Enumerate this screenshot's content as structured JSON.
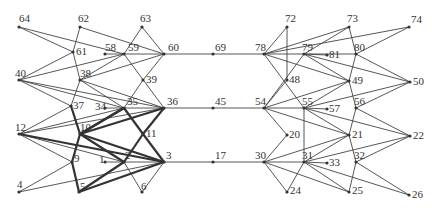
{
  "diagram": {
    "type": "network-graph",
    "colors": {
      "edge": "#444444",
      "thick_edge": "#333333",
      "label": "#333333",
      "background": "#ffffff"
    },
    "nodes": [
      {
        "id": "64",
        "x": 19,
        "y": 27,
        "lx": 0,
        "ly": -5
      },
      {
        "id": "62",
        "x": 80,
        "y": 27,
        "lx": -2,
        "ly": -5
      },
      {
        "id": "63",
        "x": 142,
        "y": 27,
        "lx": -2,
        "ly": -5
      },
      {
        "id": "61",
        "x": 73,
        "y": 52,
        "lx": 3,
        "ly": 3
      },
      {
        "id": "58",
        "x": 105,
        "y": 54,
        "lx": 0,
        "ly": -3
      },
      {
        "id": "59",
        "x": 124,
        "y": 54,
        "lx": 4,
        "ly": -3
      },
      {
        "id": "60",
        "x": 164,
        "y": 54,
        "lx": 4,
        "ly": -3
      },
      {
        "id": "40",
        "x": 19,
        "y": 80,
        "lx": -4,
        "ly": -3
      },
      {
        "id": "38",
        "x": 80,
        "y": 80,
        "lx": 0,
        "ly": -3
      },
      {
        "id": "39",
        "x": 143,
        "y": 80,
        "lx": 3,
        "ly": 3
      },
      {
        "id": "37",
        "x": 71,
        "y": 106,
        "lx": 2,
        "ly": 3
      },
      {
        "id": "34",
        "x": 105,
        "y": 108,
        "lx": -10,
        "ly": 2
      },
      {
        "id": "35",
        "x": 124,
        "y": 108,
        "lx": 3,
        "ly": -3
      },
      {
        "id": "36",
        "x": 164,
        "y": 108,
        "lx": 3,
        "ly": -3
      },
      {
        "id": "12",
        "x": 19,
        "y": 134,
        "lx": -4,
        "ly": -3
      },
      {
        "id": "10",
        "x": 80,
        "y": 134,
        "lx": 0,
        "ly": -3
      },
      {
        "id": "11",
        "x": 143,
        "y": 134,
        "lx": 3,
        "ly": 3
      },
      {
        "id": "9",
        "x": 72,
        "y": 162,
        "lx": 2,
        "ly": 0
      },
      {
        "id": "1",
        "x": 105,
        "y": 162,
        "lx": -6,
        "ly": 1
      },
      {
        "id": "2",
        "x": 124,
        "y": 162,
        "lx": 1,
        "ly": -3
      },
      {
        "id": "3",
        "x": 164,
        "y": 162,
        "lx": 2,
        "ly": -3
      },
      {
        "id": "4",
        "x": 19,
        "y": 192,
        "lx": -2,
        "ly": -4
      },
      {
        "id": "5",
        "x": 79,
        "y": 192,
        "lx": 1,
        "ly": -2
      },
      {
        "id": "6",
        "x": 142,
        "y": 192,
        "lx": -1,
        "ly": -2
      },
      {
        "id": "69",
        "x": 213,
        "y": 54,
        "lx": 2,
        "ly": -3
      },
      {
        "id": "45",
        "x": 213,
        "y": 108,
        "lx": 2,
        "ly": -3
      },
      {
        "id": "17",
        "x": 213,
        "y": 162,
        "lx": 2,
        "ly": -3
      },
      {
        "id": "72",
        "x": 287,
        "y": 27,
        "lx": -2,
        "ly": -5
      },
      {
        "id": "73",
        "x": 349,
        "y": 27,
        "lx": -2,
        "ly": -5
      },
      {
        "id": "74",
        "x": 409,
        "y": 27,
        "lx": 2,
        "ly": -4
      },
      {
        "id": "78",
        "x": 264,
        "y": 54,
        "lx": -9,
        "ly": -3
      },
      {
        "id": "79",
        "x": 304,
        "y": 54,
        "lx": -2,
        "ly": -3
      },
      {
        "id": "81",
        "x": 327,
        "y": 55,
        "lx": 2,
        "ly": 3
      },
      {
        "id": "80",
        "x": 356,
        "y": 54,
        "lx": -2,
        "ly": -3
      },
      {
        "id": "48",
        "x": 287,
        "y": 80,
        "lx": 2,
        "ly": 3
      },
      {
        "id": "49",
        "x": 349,
        "y": 81,
        "lx": 3,
        "ly": 3
      },
      {
        "id": "50",
        "x": 410,
        "y": 82,
        "lx": 3,
        "ly": 3
      },
      {
        "id": "54",
        "x": 264,
        "y": 108,
        "lx": -9,
        "ly": -3
      },
      {
        "id": "55",
        "x": 304,
        "y": 108,
        "lx": -2,
        "ly": -3
      },
      {
        "id": "57",
        "x": 327,
        "y": 109,
        "lx": 2,
        "ly": 3
      },
      {
        "id": "56",
        "x": 356,
        "y": 108,
        "lx": -2,
        "ly": -3
      },
      {
        "id": "20",
        "x": 287,
        "y": 135,
        "lx": 2,
        "ly": 3
      },
      {
        "id": "21",
        "x": 349,
        "y": 135,
        "lx": 3,
        "ly": 3
      },
      {
        "id": "22",
        "x": 410,
        "y": 136,
        "lx": 3,
        "ly": 3
      },
      {
        "id": "30",
        "x": 264,
        "y": 162,
        "lx": -9,
        "ly": -3
      },
      {
        "id": "31",
        "x": 304,
        "y": 162,
        "lx": -2,
        "ly": -3
      },
      {
        "id": "33",
        "x": 327,
        "y": 163,
        "lx": 2,
        "ly": 3
      },
      {
        "id": "32",
        "x": 356,
        "y": 162,
        "lx": -2,
        "ly": -3
      },
      {
        "id": "24",
        "x": 287,
        "y": 192,
        "lx": 3,
        "ly": 2
      },
      {
        "id": "25",
        "x": 349,
        "y": 192,
        "lx": 3,
        "ly": 2
      },
      {
        "id": "26",
        "x": 409,
        "y": 195,
        "lx": 3,
        "ly": 3
      }
    ],
    "edges": [
      [
        "64",
        "61"
      ],
      [
        "64",
        "59"
      ],
      [
        "62",
        "61"
      ],
      [
        "62",
        "60"
      ],
      [
        "63",
        "59"
      ],
      [
        "63",
        "60"
      ],
      [
        "61",
        "40"
      ],
      [
        "61",
        "38"
      ],
      [
        "58",
        "59"
      ],
      [
        "59",
        "60"
      ],
      [
        "59",
        "40"
      ],
      [
        "59",
        "38"
      ],
      [
        "59",
        "36"
      ],
      [
        "60",
        "38"
      ],
      [
        "60",
        "39"
      ],
      [
        "60",
        "69"
      ],
      [
        "40",
        "37"
      ],
      [
        "40",
        "35"
      ],
      [
        "40",
        "36"
      ],
      [
        "38",
        "37"
      ],
      [
        "38",
        "35"
      ],
      [
        "38",
        "36"
      ],
      [
        "39",
        "35"
      ],
      [
        "37",
        "12"
      ],
      [
        "37",
        "10"
      ],
      [
        "34",
        "35"
      ],
      [
        "35",
        "36"
      ],
      [
        "35",
        "12"
      ],
      [
        "36",
        "12"
      ],
      [
        "36",
        "45"
      ],
      [
        "12",
        "9"
      ],
      [
        "12",
        "2"
      ],
      [
        "9",
        "4"
      ],
      [
        "9",
        "5"
      ],
      [
        "1",
        "2"
      ],
      [
        "2",
        "3"
      ],
      [
        "2",
        "6"
      ],
      [
        "3",
        "6"
      ],
      [
        "3",
        "4"
      ],
      [
        "3",
        "17"
      ],
      [
        "69",
        "78"
      ],
      [
        "45",
        "54"
      ],
      [
        "17",
        "30"
      ],
      [
        "78",
        "72"
      ],
      [
        "78",
        "73"
      ],
      [
        "78",
        "74"
      ],
      [
        "78",
        "79"
      ],
      [
        "78",
        "49"
      ],
      [
        "78",
        "55"
      ],
      [
        "72",
        "48"
      ],
      [
        "79",
        "73"
      ],
      [
        "79",
        "80"
      ],
      [
        "79",
        "81"
      ],
      [
        "79",
        "49"
      ],
      [
        "79",
        "50"
      ],
      [
        "79",
        "54"
      ],
      [
        "73",
        "80"
      ],
      [
        "74",
        "80"
      ],
      [
        "80",
        "49"
      ],
      [
        "80",
        "50"
      ],
      [
        "48",
        "54"
      ],
      [
        "54",
        "49"
      ],
      [
        "54",
        "55"
      ],
      [
        "54",
        "21"
      ],
      [
        "54",
        "20"
      ],
      [
        "49",
        "55"
      ],
      [
        "49",
        "56"
      ],
      [
        "50",
        "55"
      ],
      [
        "50",
        "56"
      ],
      [
        "55",
        "57"
      ],
      [
        "55",
        "21"
      ],
      [
        "55",
        "22"
      ],
      [
        "55",
        "31"
      ],
      [
        "56",
        "21"
      ],
      [
        "56",
        "22"
      ],
      [
        "20",
        "30"
      ],
      [
        "21",
        "30"
      ],
      [
        "21",
        "31"
      ],
      [
        "21",
        "32"
      ],
      [
        "22",
        "31"
      ],
      [
        "22",
        "32"
      ],
      [
        "30",
        "31"
      ],
      [
        "30",
        "24"
      ],
      [
        "30",
        "25"
      ],
      [
        "31",
        "33"
      ],
      [
        "31",
        "24"
      ],
      [
        "31",
        "25"
      ],
      [
        "31",
        "26"
      ],
      [
        "32",
        "25"
      ],
      [
        "32",
        "26"
      ]
    ],
    "thick_edges": [
      [
        "37",
        "10"
      ],
      [
        "10",
        "9"
      ],
      [
        "9",
        "5"
      ],
      [
        "5",
        "2"
      ],
      [
        "10",
        "2"
      ],
      [
        "10",
        "3"
      ],
      [
        "10",
        "36"
      ],
      [
        "10",
        "35"
      ],
      [
        "12",
        "3"
      ],
      [
        "35",
        "11"
      ],
      [
        "11",
        "3"
      ],
      [
        "36",
        "11"
      ],
      [
        "11",
        "2"
      ],
      [
        "5",
        "3"
      ],
      [
        "35",
        "10"
      ]
    ]
  }
}
